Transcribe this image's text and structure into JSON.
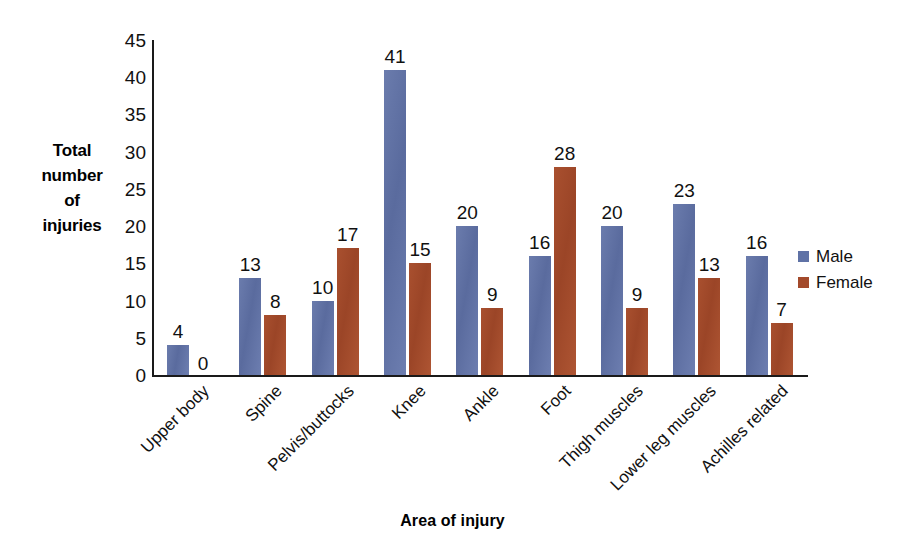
{
  "chart_data": {
    "type": "bar",
    "title": "",
    "xlabel": "Area of injury",
    "ylabel": "Total number of injuries",
    "ylabel_lines": [
      "Total",
      "number",
      "of",
      "injuries"
    ],
    "categories": [
      "Upper body",
      "Spine",
      "Pelvis/buttocks",
      "Knee",
      "Ankle",
      "Foot",
      "Thigh muscles",
      "Lower leg muscles",
      "Achilles related"
    ],
    "series": [
      {
        "name": "Male",
        "color": "#5f72a6",
        "values": [
          4,
          13,
          10,
          41,
          20,
          16,
          20,
          23,
          16
        ]
      },
      {
        "name": "Female",
        "color": "#a34a2b",
        "values": [
          0,
          8,
          17,
          15,
          9,
          28,
          9,
          13,
          7
        ]
      }
    ],
    "ylim": [
      0,
      45
    ],
    "ytick_step": 5,
    "ytick_labels": [
      "0",
      "5",
      "10",
      "15",
      "20",
      "25",
      "30",
      "35",
      "40",
      "45"
    ],
    "grid": false,
    "legend_position": "right",
    "data_labels": true,
    "xtick_rotation": -45
  }
}
